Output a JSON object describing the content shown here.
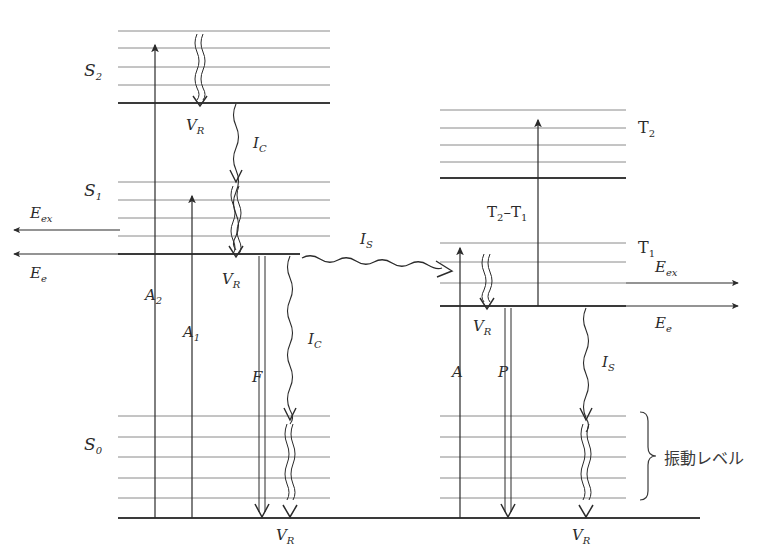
{
  "diagram": {
    "type": "energy-level-diagram",
    "background": "#ffffff",
    "line_color_thick": "#3a3a3a",
    "line_color_thin": "#8a8a8a",
    "arrow_color": "#2b2b2b",
    "width": 764,
    "height": 552
  },
  "labels": {
    "s2": "S",
    "s2_sub": "2",
    "s1": "S",
    "s1_sub": "1",
    "s0": "S",
    "s0_sub": "0",
    "t2": "T",
    "t2_sub": "2",
    "t1": "T",
    "t1_sub": "1",
    "vr": "V",
    "vr_sub": "R",
    "ic": "I",
    "ic_sub": "C",
    "is": "I",
    "is_sub": "S",
    "a2": "A",
    "a2_sub": "2",
    "a1": "A",
    "a1_sub": "1",
    "a": "A",
    "f": "F",
    "p": "P",
    "eex": "E",
    "eex_sub": "ex",
    "ee": "E",
    "ee_sub": "e",
    "t2t1_left": "T",
    "t2t1_left_sub": "2",
    "t2t1_dash": "–",
    "t2t1_right": "T",
    "t2t1_right_sub": "1",
    "vibrational_levels": "振動レベル"
  },
  "levels": {
    "singlet": [
      {
        "name": "S2",
        "base_y": 103,
        "vib_y": [
          31,
          48,
          67,
          85
        ]
      },
      {
        "name": "S1",
        "base_y": 254,
        "vib_y": [
          182,
          200,
          218,
          236
        ]
      },
      {
        "name": "S0",
        "base_y": 518,
        "vib_y": [
          416,
          437,
          457,
          478,
          498
        ]
      }
    ],
    "triplet": [
      {
        "name": "T2",
        "base_y": 178,
        "vib_y": [
          110,
          128,
          145,
          162
        ]
      },
      {
        "name": "T1",
        "base_y": 306,
        "vib_y": [
          243,
          262,
          283
        ]
      }
    ]
  },
  "transitions": [
    {
      "id": "A2",
      "kind": "absorption",
      "label": "A",
      "sub": "2",
      "x": 155,
      "from_y": 518,
      "to_y": 45
    },
    {
      "id": "A1",
      "kind": "absorption",
      "label": "A",
      "sub": "1",
      "x": 192,
      "from_y": 518,
      "to_y": 196
    },
    {
      "id": "VR_S2",
      "kind": "vibrational-relaxation",
      "label": "V",
      "sub": "R",
      "x": 200,
      "from_y": 35,
      "to_y": 103
    },
    {
      "id": "IC_S2_S1",
      "kind": "internal-conversion",
      "label": "I",
      "sub": "C",
      "x": 236,
      "from_y": 103,
      "to_y": 254
    },
    {
      "id": "VR_S1",
      "kind": "vibrational-relaxation",
      "label": "V",
      "sub": "R",
      "x": 236,
      "from_y": 186,
      "to_y": 254
    },
    {
      "id": "F",
      "kind": "fluorescence",
      "label": "F",
      "sub": "",
      "x": 262,
      "from_y": 256,
      "to_y": 518
    },
    {
      "id": "IC_S1_S0",
      "kind": "internal-conversion",
      "label": "I",
      "sub": "C",
      "x": 290,
      "from_y": 256,
      "to_y": 518
    },
    {
      "id": "IS",
      "kind": "intersystem-crossing",
      "label": "I",
      "sub": "S",
      "from_x": 300,
      "to_x": 452,
      "from_y": 258,
      "to_y": 272
    },
    {
      "id": "A",
      "kind": "absorption",
      "label": "A",
      "sub": "",
      "x": 460,
      "from_y": 518,
      "to_y": 248
    },
    {
      "id": "VR_T1",
      "kind": "vibrational-relaxation",
      "label": "V",
      "sub": "R",
      "x": 487,
      "from_y": 254,
      "to_y": 306
    },
    {
      "id": "T2T1",
      "kind": "triplet-triplet-absorption",
      "label": "T2-T1",
      "x": 538,
      "from_y": 306,
      "to_y": 120
    },
    {
      "id": "P",
      "kind": "phosphorescence",
      "label": "P",
      "sub": "",
      "x": 508,
      "from_y": 308,
      "to_y": 518
    },
    {
      "id": "IS_T1_S0",
      "kind": "intersystem-crossing",
      "label": "I",
      "sub": "S",
      "x": 586,
      "from_y": 308,
      "to_y": 518
    }
  ],
  "side_arrows": {
    "left": [
      {
        "id": "Eex-left",
        "label": "E",
        "sub": "ex",
        "direction": "left",
        "y": 230,
        "x_from": 120,
        "x_to": 12
      },
      {
        "id": "Ee-left",
        "label": "E",
        "sub": "e",
        "direction": "left",
        "y": 254,
        "x_from": 120,
        "x_to": 12
      }
    ],
    "right": [
      {
        "id": "Eex-right",
        "label": "E",
        "sub": "ex",
        "direction": "right",
        "y": 283,
        "x_from": 626,
        "x_to": 740
      },
      {
        "id": "Ee-right",
        "label": "E",
        "sub": "e",
        "direction": "right",
        "y": 306,
        "x_from": 626,
        "x_to": 740
      }
    ]
  },
  "brace": {
    "label": "振動レベル",
    "x": 650,
    "y_top": 412,
    "y_bottom": 496
  }
}
